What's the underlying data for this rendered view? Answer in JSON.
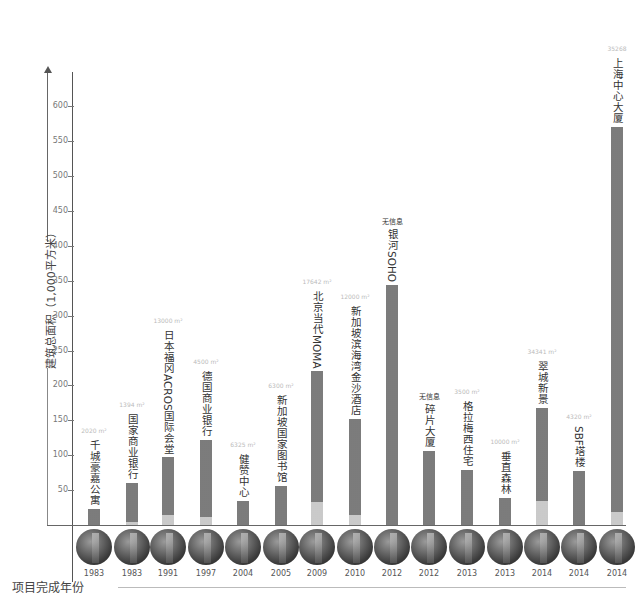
{
  "chart_data": {
    "type": "bar",
    "title": "",
    "xlabel": "项目完成年份",
    "ylabel": "建筑总面积（1,000平方米）",
    "ylim": [
      0,
      630
    ],
    "yticks": [
      50,
      100,
      150,
      200,
      250,
      300,
      350,
      400,
      450,
      500,
      550,
      600
    ],
    "grid": false,
    "legend": null,
    "categories": [
      "千城豪嘉公寓",
      "国家商业银行",
      "日本福冈ACROS国际会堂",
      "德国商业银行",
      "健赞中心",
      "新加坡国家图书馆",
      "北京当代MOMA",
      "新加坡滨海湾金沙酒店",
      "银河SOHO",
      "碎片大厦",
      "格拉梅西住宅",
      "垂直森林",
      "翠城新景",
      "SBF塔楼",
      "上海中心大厦"
    ],
    "years": [
      "1983",
      "1983",
      "1991",
      "1997",
      "2004",
      "2005",
      "2009",
      "2010",
      "2012",
      "2012",
      "2013",
      "2013",
      "2014",
      "2014",
      "2014"
    ],
    "values": [
      23,
      60,
      97,
      122,
      34,
      56,
      220,
      152,
      344,
      106,
      79,
      39,
      168,
      77,
      570
    ],
    "lower_segment": [
      0,
      4,
      14,
      12,
      0,
      0,
      33,
      14,
      0,
      0,
      0,
      0,
      34,
      0,
      18
    ],
    "annotations": [
      "2020 m²",
      "1394 m²",
      "13000 m²",
      "4500 m²",
      "6325 m²",
      "6300 m²",
      "17642 m²",
      "12000 m²",
      "无信息",
      "无信息",
      "3500 m²",
      "10000 m²",
      "34341 m²",
      "4320 m²",
      "35268"
    ]
  },
  "axis": {
    "y_title": "建筑总面积（1,000平方米）",
    "x_title": "项目完成年份",
    "ticks": [
      "600",
      "550",
      "500",
      "450",
      "400",
      "350",
      "300",
      "250",
      "200",
      "150",
      "100",
      "50"
    ]
  }
}
